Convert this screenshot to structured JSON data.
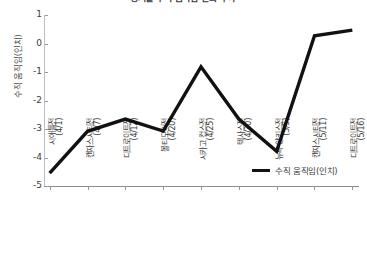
{
  "chart_data": {
    "type": "line",
    "title": "경기별 수직 움직임 변화 추이",
    "xlabel": "",
    "ylabel": "수직 움직임(인치)",
    "ylim": [
      -5,
      1
    ],
    "ytick_labels": [
      "1",
      "0",
      "-1",
      "-2",
      "-3",
      "-4",
      "-5"
    ],
    "ytick_values": [
      1,
      0,
      -1,
      -2,
      -3,
      -4,
      -5
    ],
    "grid": false,
    "legend_position": "lower right",
    "categories": [
      "시애틀전\n(4/1)",
      "캔자스시티전\n(4/7)",
      "디트로이트전\n(4/12)",
      "볼티모어전\n(4/20)",
      "시카고 컵스전\n(4/25)",
      "텍사스전\n(4/30)",
      "뉴욕 양키스전\n(5/5)",
      "캔자스시티전\n(5/11)",
      "디트로이트전\n(5/16)"
    ],
    "category_teams": [
      "시애틀전",
      "캔자스시티전",
      "디트로이트전",
      "볼티모어전",
      "시카고 컵스전",
      "텍사스전",
      "뉴욕 양키스전",
      "캔자스시티전",
      "디트로이트전"
    ],
    "category_dates": [
      "(4/1)",
      "(4/7)",
      "(4/12)",
      "(4/20)",
      "(4/25)",
      "(4/30)",
      "(5/5)",
      "(5/11)",
      "(5/16)"
    ],
    "series": [
      {
        "name": "수직 움직임(인치)",
        "color": "#111111",
        "values": [
          -4.55,
          -3.08,
          -2.65,
          -3.07,
          -0.82,
          -2.65,
          -3.78,
          0.27,
          0.47
        ]
      }
    ]
  },
  "legend": {
    "entries": [
      {
        "label": "수직 움직임(인치)",
        "color": "#111111"
      }
    ]
  }
}
